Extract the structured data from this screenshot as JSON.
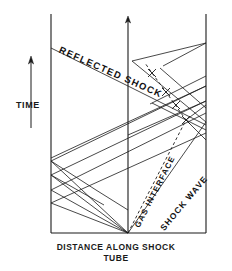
{
  "figure": {
    "type": "x-t wave diagram",
    "axis_x_label_line1": "DISTANCE ALONG SHOCK",
    "axis_x_label_line2": "TUBE",
    "axis_y_label": "TIME",
    "line_color": "#1a1a1a",
    "background": "#ffffff"
  },
  "labels": {
    "reflected_shock": "REFLECTED SHOCK",
    "gas_interface": "GAS INTERFACE",
    "shock_wave": "SHOCK WAVE"
  },
  "icons": {
    "time_arrow": "up-arrow-icon",
    "axis_arrow": "up-arrow-icon"
  },
  "chart_data": {
    "type": "line",
    "title": "",
    "xlabel": "DISTANCE ALONG SHOCK TUBE",
    "ylabel": "TIME",
    "grid": false,
    "legend": "none",
    "xlim": [
      51,
      206
    ],
    "ylim": [
      233,
      14
    ],
    "origin": [
      128,
      233
    ],
    "left_wall_x": 51,
    "right_wall_x": 206,
    "center_axis_x": 128,
    "top_y": 14,
    "baseline_y": 233,
    "solid_lines": [
      {
        "name": "reflected-shock",
        "pts": [
          [
            51,
            48
          ],
          [
            128,
            86
          ],
          [
            206,
            125
          ]
        ]
      },
      {
        "name": "shock-wave-incident",
        "pts": [
          [
            128,
            233
          ],
          [
            206,
            122
          ]
        ]
      },
      {
        "name": "shock-wave-refl-1",
        "pts": [
          [
            206,
            122
          ],
          [
            143,
            70
          ],
          [
            132,
            61
          ]
        ]
      },
      {
        "name": "shock-wave-refl-1b",
        "pts": [
          [
            132,
            61
          ],
          [
            206,
            43
          ]
        ]
      },
      {
        "name": "fan-ray-1",
        "pts": [
          [
            128,
            233
          ],
          [
            51,
            161
          ]
        ]
      },
      {
        "name": "fan-ray-1r",
        "pts": [
          [
            51,
            161
          ],
          [
            206,
            86
          ]
        ]
      },
      {
        "name": "fan-ray-2",
        "pts": [
          [
            128,
            233
          ],
          [
            51,
            175
          ]
        ]
      },
      {
        "name": "fan-ray-2r",
        "pts": [
          [
            51,
            175
          ],
          [
            206,
            101
          ]
        ]
      },
      {
        "name": "fan-ray-3",
        "pts": [
          [
            128,
            233
          ],
          [
            51,
            190
          ]
        ]
      },
      {
        "name": "fan-ray-3r",
        "pts": [
          [
            51,
            190
          ],
          [
            206,
            113
          ]
        ]
      },
      {
        "name": "fan-ray-4",
        "pts": [
          [
            128,
            233
          ],
          [
            51,
            203
          ]
        ]
      },
      {
        "name": "fan-ray-4r",
        "pts": [
          [
            51,
            203
          ],
          [
            206,
            133
          ]
        ]
      },
      {
        "name": "left-refl-a",
        "pts": [
          [
            51,
            161
          ],
          [
            96,
            190
          ],
          [
            128,
            210
          ]
        ]
      },
      {
        "name": "left-refl-b",
        "pts": [
          [
            51,
            175
          ],
          [
            104,
            205
          ]
        ]
      },
      {
        "name": "cross-ray-1",
        "pts": [
          [
            206,
            86
          ],
          [
            128,
            122
          ],
          [
            51,
            158
          ]
        ]
      },
      {
        "name": "cross-ray-2",
        "pts": [
          [
            206,
            101
          ],
          [
            128,
            135
          ]
        ]
      },
      {
        "name": "upper-right-1",
        "pts": [
          [
            206,
            43
          ],
          [
            163,
            66
          ]
        ]
      },
      {
        "name": "upper-right-2",
        "pts": [
          [
            206,
            76
          ],
          [
            150,
            104
          ]
        ]
      },
      {
        "name": "upper-right-3",
        "pts": [
          [
            160,
            68
          ],
          [
            206,
            108
          ]
        ]
      },
      {
        "name": "upper-right-4",
        "pts": [
          [
            152,
            103
          ],
          [
            206,
            130
          ]
        ]
      },
      {
        "name": "node-cross-1",
        "pts": [
          [
            186,
            120
          ],
          [
            206,
            105
          ]
        ]
      },
      {
        "name": "node-cross-2",
        "pts": [
          [
            186,
            120
          ],
          [
            206,
            140
          ]
        ]
      }
    ],
    "dashed_lines": [
      {
        "name": "gas-interface",
        "pts": [
          [
            128,
            233
          ],
          [
            186,
            120
          ],
          [
            166,
            92
          ],
          [
            152,
            73
          ],
          [
            145,
            63
          ]
        ]
      }
    ],
    "tick_marks": [
      {
        "name": "tick-1",
        "x": 152,
        "y": 73
      },
      {
        "name": "tick-2",
        "x": 166,
        "y": 92
      },
      {
        "name": "tick-3",
        "x": 176,
        "y": 105
      },
      {
        "name": "tick-4",
        "x": 186,
        "y": 120
      }
    ]
  }
}
